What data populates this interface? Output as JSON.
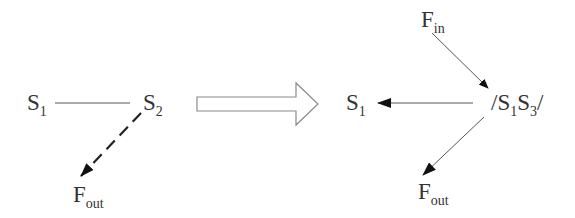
{
  "diagram": {
    "left": {
      "node_a": {
        "main": "S",
        "sub": "1"
      },
      "node_b": {
        "main": "S",
        "sub": "2"
      },
      "output": {
        "main": "F",
        "sub": "out"
      },
      "edges": [
        {
          "from": "S1",
          "to": "S2",
          "style": "solid",
          "arrow": "none"
        },
        {
          "from": "S2",
          "to": "Fout",
          "style": "dashed",
          "arrow": "end"
        }
      ]
    },
    "transition": {
      "shape": "block-arrow",
      "direction": "right"
    },
    "right": {
      "input": {
        "main": "F",
        "sub": "in"
      },
      "node_a": {
        "main": "S",
        "sub": "1"
      },
      "merged": {
        "prefix": "/",
        "a_main": "S",
        "a_sub": "1",
        "b_main": "S",
        "b_sub": "3",
        "suffix": "/"
      },
      "output": {
        "main": "F",
        "sub": "out"
      },
      "edges": [
        {
          "from": "Fin",
          "to": "/S1S3/",
          "style": "solid",
          "arrow": "end"
        },
        {
          "from": "/S1S3/",
          "to": "S1",
          "style": "solid",
          "arrow": "end"
        },
        {
          "from": "/S1S3/",
          "to": "Fout",
          "style": "solid",
          "arrow": "end"
        }
      ]
    },
    "colors": {
      "text": "#333333",
      "line": "#555555",
      "block_arrow_stroke": "#888888"
    }
  }
}
